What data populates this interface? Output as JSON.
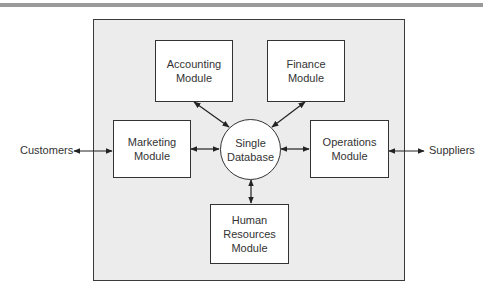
{
  "diagram": {
    "title": "",
    "center": {
      "line1": "Single",
      "line2": "Database"
    },
    "modules": {
      "accounting": {
        "line1": "Accounting",
        "line2": "Module"
      },
      "finance": {
        "line1": "Finance",
        "line2": "Module"
      },
      "marketing": {
        "line1": "Marketing",
        "line2": "Module"
      },
      "operations": {
        "line1": "Operations",
        "line2": "Module"
      },
      "human_resources": {
        "line1": "Human",
        "line2": "Resources",
        "line3": "Module"
      }
    },
    "external": {
      "left": "Customers",
      "right": "Suppliers"
    },
    "connections": [
      [
        "Customers",
        "Marketing Module"
      ],
      [
        "Marketing Module",
        "Single Database"
      ],
      [
        "Accounting Module",
        "Single Database"
      ],
      [
        "Finance Module",
        "Single Database"
      ],
      [
        "Operations Module",
        "Single Database"
      ],
      [
        "Human Resources Module",
        "Single Database"
      ],
      [
        "Operations Module",
        "Suppliers"
      ]
    ],
    "colors": {
      "frame_bg": "#ececec",
      "box_bg": "#ffffff",
      "stroke": "#333333",
      "top_rule": "#9a9a9a"
    }
  }
}
